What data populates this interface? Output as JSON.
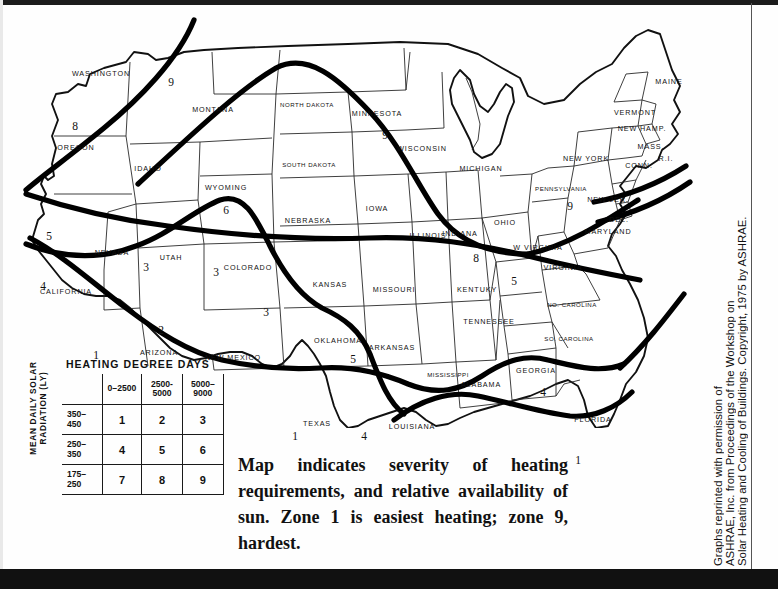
{
  "figure": {
    "caption": "Map indicates severity of heating requirements, and relative availability of sun. Zone 1 is easiest heating; zone 9, hardest.",
    "credit_lines": [
      "Graphs reprinted with permission of",
      "ASHRAE, Inc. from Proceedings of the Workshop on",
      "Solar Heating and Cooling of Buildings. Copyright, 1975 by ASHRAE."
    ]
  },
  "legend": {
    "column_axis_title": "HEATING DEGREE DAYS",
    "row_axis_title": "MEAN DAILY SOLAR RADIATION (LY)",
    "column_headers": [
      "0–2500",
      "2500-\n5000",
      "5000–\n9000"
    ],
    "row_headers": [
      "350–\n450",
      "250–\n350",
      "175–\n250"
    ],
    "rows": [
      {
        "header": "350–450",
        "values": [
          "1",
          "2",
          "3"
        ]
      },
      {
        "header": "250–350",
        "values": [
          "4",
          "5",
          "6"
        ]
      },
      {
        "header": "175–250",
        "values": [
          "7",
          "8",
          "9"
        ]
      }
    ]
  },
  "map": {
    "state_labels": [
      {
        "name": "WASHINGTON",
        "x": 93,
        "y": 65
      },
      {
        "name": "OREGON",
        "x": 68,
        "y": 139
      },
      {
        "name": "IDAHO",
        "x": 140,
        "y": 160
      },
      {
        "name": "MONTANA",
        "x": 205,
        "y": 101
      },
      {
        "name": "WYOMING",
        "x": 218,
        "y": 179
      },
      {
        "name": "NEVADA",
        "x": 104,
        "y": 244
      },
      {
        "name": "UTAH",
        "x": 163,
        "y": 249
      },
      {
        "name": "COLORADO",
        "x": 240,
        "y": 259
      },
      {
        "name": "CALIFORNIA",
        "x": 58,
        "y": 283
      },
      {
        "name": "ARIZONA",
        "x": 151,
        "y": 344
      },
      {
        "name": "NEW MEXICO",
        "x": 225,
        "y": 349
      },
      {
        "name": "NORTH DAKOTA",
        "x": 299,
        "y": 96
      },
      {
        "name": "SOUTH DAKOTA",
        "x": 301,
        "y": 156
      },
      {
        "name": "NEBRASKA",
        "x": 300,
        "y": 212
      },
      {
        "name": "KANSAS",
        "x": 322,
        "y": 276
      },
      {
        "name": "OKLAHOMA",
        "x": 330,
        "y": 332
      },
      {
        "name": "TEXAS",
        "x": 309,
        "y": 415
      },
      {
        "name": "MINNESOTA",
        "x": 369,
        "y": 105
      },
      {
        "name": "IOWA",
        "x": 369,
        "y": 200
      },
      {
        "name": "MISSOURI",
        "x": 386,
        "y": 281
      },
      {
        "name": "ARKANSAS",
        "x": 384,
        "y": 339
      },
      {
        "name": "LOUISIANA",
        "x": 404,
        "y": 418
      },
      {
        "name": "WISCONSIN",
        "x": 414,
        "y": 140
      },
      {
        "name": "ILLINOIS",
        "x": 420,
        "y": 227
      },
      {
        "name": "MISSISSIPPI",
        "x": 440,
        "y": 366
      },
      {
        "name": "MICHIGAN",
        "x": 473,
        "y": 160
      },
      {
        "name": "INDIANA",
        "x": 452,
        "y": 225
      },
      {
        "name": "KENTUKY",
        "x": 469,
        "y": 281
      },
      {
        "name": "TENNESSEE",
        "x": 481,
        "y": 313
      },
      {
        "name": "ALABAMA",
        "x": 473,
        "y": 376
      },
      {
        "name": "OHIO",
        "x": 497,
        "y": 214
      },
      {
        "name": "W VIRGINIA",
        "x": 530,
        "y": 239
      },
      {
        "name": "VIRGINIA",
        "x": 555,
        "y": 259
      },
      {
        "name": "NO. CAROLINA",
        "x": 564,
        "y": 296
      },
      {
        "name": "SO. CAROLINA",
        "x": 561,
        "y": 330
      },
      {
        "name": "GEORGIA",
        "x": 528,
        "y": 362
      },
      {
        "name": "FLORIDA",
        "x": 585,
        "y": 411
      },
      {
        "name": "PENNSYLVANIA",
        "x": 553,
        "y": 180
      },
      {
        "name": "NEW YORK",
        "x": 578,
        "y": 150
      },
      {
        "name": "NEW JER.",
        "x": 600,
        "y": 191
      },
      {
        "name": "DEL.",
        "x": 611,
        "y": 211
      },
      {
        "name": "MARYLAND",
        "x": 600,
        "y": 223
      },
      {
        "name": "VERMONT",
        "x": 627,
        "y": 104
      },
      {
        "name": "NEW HAMP.",
        "x": 634,
        "y": 120
      },
      {
        "name": "MASS.",
        "x": 643,
        "y": 138
      },
      {
        "name": "CONN.",
        "x": 631,
        "y": 157
      },
      {
        "name": "R.I.",
        "x": 658,
        "y": 150
      },
      {
        "name": "MAINE",
        "x": 661,
        "y": 73
      }
    ],
    "zone_numbers": [
      {
        "value": "8",
        "x": 67,
        "y": 118
      },
      {
        "value": "9",
        "x": 163,
        "y": 74
      },
      {
        "value": "5",
        "x": 41,
        "y": 228
      },
      {
        "value": "4",
        "x": 35,
        "y": 278
      },
      {
        "value": "1",
        "x": 88,
        "y": 347
      },
      {
        "value": "2",
        "x": 153,
        "y": 322
      },
      {
        "value": "3",
        "x": 138,
        "y": 259
      },
      {
        "value": "3",
        "x": 208,
        "y": 264
      },
      {
        "value": "3",
        "x": 258,
        "y": 304
      },
      {
        "value": "6",
        "x": 218,
        "y": 202
      },
      {
        "value": "9",
        "x": 377,
        "y": 127
      },
      {
        "value": "1",
        "x": 287,
        "y": 428
      },
      {
        "value": "5",
        "x": 345,
        "y": 351
      },
      {
        "value": "4",
        "x": 356,
        "y": 428
      },
      {
        "value": "8",
        "x": 468,
        "y": 250
      },
      {
        "value": "5",
        "x": 506,
        "y": 273
      },
      {
        "value": "9",
        "x": 562,
        "y": 198
      },
      {
        "value": "4",
        "x": 535,
        "y": 384
      },
      {
        "value": "1",
        "x": 570,
        "y": 452
      }
    ]
  }
}
